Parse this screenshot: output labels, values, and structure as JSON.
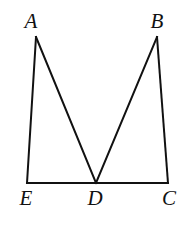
{
  "figure": {
    "type": "geometry-diagram",
    "background_color": "#ffffff",
    "stroke_color": "#111111",
    "stroke_width": 2,
    "canvas": {
      "width": 184,
      "height": 240
    },
    "points": [
      {
        "id": "A",
        "label": "A",
        "x": 36,
        "y": 37,
        "label_x": 31,
        "label_y": 21
      },
      {
        "id": "B",
        "label": "B",
        "x": 157,
        "y": 37,
        "label_x": 157,
        "label_y": 21
      },
      {
        "id": "E",
        "label": "E",
        "x": 27,
        "y": 183,
        "label_x": 26,
        "label_y": 198
      },
      {
        "id": "D",
        "label": "D",
        "x": 96,
        "y": 183,
        "label_x": 95,
        "label_y": 198
      },
      {
        "id": "C",
        "label": "C",
        "x": 168,
        "y": 183,
        "label_x": 169,
        "label_y": 198
      }
    ],
    "segments": [
      {
        "id": "EA",
        "from": "E",
        "to": "A"
      },
      {
        "id": "AD",
        "from": "A",
        "to": "D"
      },
      {
        "id": "DB",
        "from": "D",
        "to": "B"
      },
      {
        "id": "BC",
        "from": "B",
        "to": "C"
      },
      {
        "id": "EC",
        "from": "E",
        "to": "C"
      }
    ]
  }
}
